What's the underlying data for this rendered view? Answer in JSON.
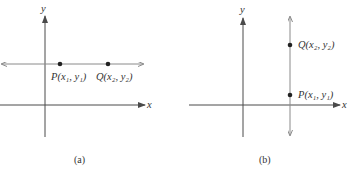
{
  "panels": [
    {
      "id": "a",
      "caption": "(a)",
      "axis_labels": {
        "x": "x",
        "y": "y"
      },
      "line": "horizontal",
      "points": [
        {
          "name": "P",
          "label": "P(x₁, y₁)"
        },
        {
          "name": "Q",
          "label": "Q(x₂, y₂)"
        }
      ]
    },
    {
      "id": "b",
      "caption": "(b)",
      "axis_labels": {
        "x": "x",
        "y": "y"
      },
      "line": "vertical",
      "points": [
        {
          "name": "Q",
          "label": "Q(x₂, y₂)"
        },
        {
          "name": "P",
          "label": "P(x₁, y₁)"
        }
      ]
    }
  ],
  "colors": {
    "axis": "#4a4a4a",
    "line": "#8a8a8a",
    "point": "#222222",
    "text": "#333333"
  }
}
